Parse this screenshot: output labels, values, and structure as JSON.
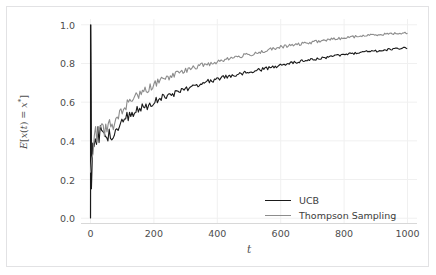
{
  "figure": {
    "background_color": "#ffffff",
    "border_color": "#e2e2e4",
    "plot_background": "#ffffff",
    "grid_color": "#f0f0f0",
    "tick_color": "#4d4d4d"
  },
  "axis": {
    "xlabel": "t",
    "ylabel_prefix": "E",
    "ylabel_body": "[x(t) = x",
    "ylabel_sup": "*",
    "ylabel_suffix": "]",
    "ylabel_plain": "E[x(t) = x*]",
    "xticks": [
      "0",
      "200",
      "400",
      "600",
      "800",
      "1000"
    ],
    "yticks": [
      "0.0",
      "0.2",
      "0.4",
      "0.6",
      "0.8",
      "1.0"
    ]
  },
  "legend": {
    "position": "lower-right",
    "entries": [
      {
        "label": "UCB",
        "color": "#1a1a1a"
      },
      {
        "label": "Thompson Sampling",
        "color": "#8c8c8c"
      }
    ]
  },
  "chart_data": {
    "type": "line",
    "title": "",
    "xlabel": "t",
    "ylabel": "E[x(t) = x*]",
    "xlim": [
      -30,
      1030
    ],
    "ylim": [
      -0.03,
      1.03
    ],
    "xticks": [
      0,
      200,
      400,
      600,
      800,
      1000
    ],
    "yticks": [
      0.0,
      0.2,
      0.4,
      0.6,
      0.8,
      1.0
    ],
    "grid": true,
    "legend_position": "lower right",
    "series": [
      {
        "name": "UCB",
        "color": "#1a1a1a",
        "linewidth": 1.1,
        "note": "Starts with a vertical spike spanning 0.0 to 1.0 at t=0, drops to ~0.15, then rises monotonically with noise toward ~0.88",
        "x": [
          0,
          1,
          3,
          6,
          10,
          15,
          20,
          25,
          30,
          35,
          40,
          45,
          50,
          60,
          70,
          80,
          90,
          100,
          120,
          140,
          160,
          180,
          200,
          220,
          240,
          260,
          280,
          300,
          320,
          340,
          360,
          380,
          400,
          420,
          440,
          460,
          480,
          500,
          520,
          540,
          560,
          580,
          600,
          620,
          640,
          660,
          680,
          700,
          720,
          740,
          760,
          780,
          800,
          820,
          840,
          860,
          880,
          900,
          920,
          940,
          960,
          980,
          1000
        ],
        "y": [
          0.0,
          1.0,
          0.15,
          0.32,
          0.4,
          0.37,
          0.44,
          0.41,
          0.46,
          0.43,
          0.47,
          0.44,
          0.42,
          0.45,
          0.4,
          0.44,
          0.47,
          0.5,
          0.53,
          0.55,
          0.57,
          0.58,
          0.6,
          0.62,
          0.63,
          0.64,
          0.66,
          0.67,
          0.68,
          0.69,
          0.7,
          0.71,
          0.72,
          0.73,
          0.735,
          0.74,
          0.75,
          0.755,
          0.76,
          0.77,
          0.775,
          0.78,
          0.79,
          0.8,
          0.805,
          0.81,
          0.815,
          0.82,
          0.825,
          0.83,
          0.835,
          0.84,
          0.845,
          0.85,
          0.855,
          0.86,
          0.862,
          0.865,
          0.868,
          0.872,
          0.875,
          0.878,
          0.88
        ]
      },
      {
        "name": "Thompson Sampling",
        "color": "#8c8c8c",
        "linewidth": 1.1,
        "note": "Rises from ~0.20 at t=0 and climbs above UCB, approaching ~0.96",
        "x": [
          0,
          1,
          3,
          6,
          10,
          15,
          20,
          25,
          30,
          35,
          40,
          45,
          50,
          60,
          70,
          80,
          90,
          100,
          120,
          140,
          160,
          180,
          200,
          220,
          240,
          260,
          280,
          300,
          320,
          340,
          360,
          380,
          400,
          420,
          440,
          460,
          480,
          500,
          520,
          540,
          560,
          580,
          600,
          620,
          640,
          660,
          680,
          700,
          720,
          740,
          760,
          780,
          800,
          820,
          840,
          860,
          880,
          900,
          920,
          940,
          960,
          980,
          1000
        ],
        "y": [
          0.2,
          0.22,
          0.27,
          0.33,
          0.38,
          0.41,
          0.43,
          0.42,
          0.45,
          0.44,
          0.46,
          0.45,
          0.47,
          0.48,
          0.47,
          0.5,
          0.53,
          0.56,
          0.6,
          0.63,
          0.65,
          0.67,
          0.69,
          0.71,
          0.72,
          0.74,
          0.75,
          0.765,
          0.775,
          0.785,
          0.795,
          0.8,
          0.81,
          0.82,
          0.825,
          0.835,
          0.84,
          0.845,
          0.855,
          0.86,
          0.87,
          0.875,
          0.885,
          0.89,
          0.895,
          0.9,
          0.905,
          0.91,
          0.915,
          0.92,
          0.925,
          0.928,
          0.932,
          0.936,
          0.94,
          0.943,
          0.946,
          0.949,
          0.951,
          0.953,
          0.955,
          0.957,
          0.958
        ]
      }
    ]
  }
}
